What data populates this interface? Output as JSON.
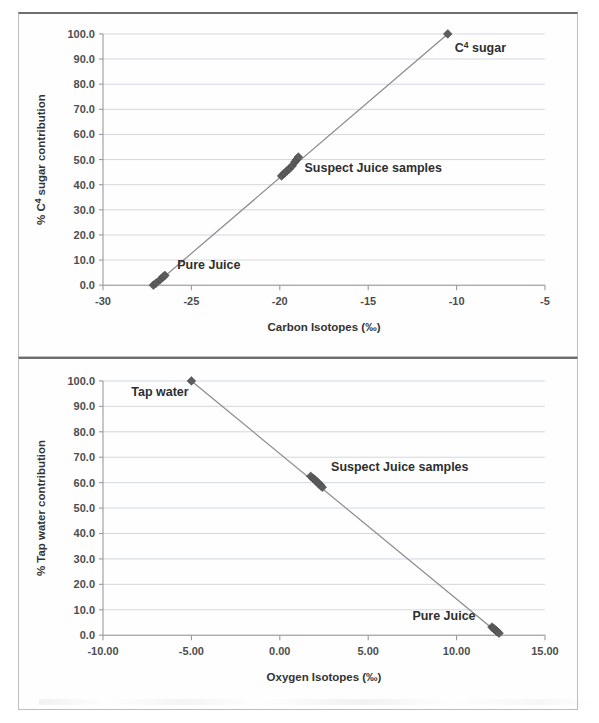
{
  "figure": {
    "background": "#ffffff",
    "panel_border_color": "#bdbdbd",
    "marker_color": "#5c5c5c",
    "line_color": "#8a8a8a",
    "grid_color": "#d2d8e0"
  },
  "chart_data": [
    {
      "id": "carbon",
      "type": "scatter",
      "title": "",
      "xlabel": "Carbon Isotopes (‰)",
      "ylabel": "% C⁴ sugar contribution",
      "ylabel_main": "% C",
      "ylabel_sup": "4",
      "ylabel_tail": " sugar contribution",
      "xlim": [
        -30,
        -5
      ],
      "ylim": [
        0,
        100
      ],
      "xticks": [
        -30,
        -25,
        -20,
        -15,
        -10,
        -5
      ],
      "xtick_labels": [
        "-30",
        "-25",
        "-20",
        "-15",
        "-10",
        "-5"
      ],
      "yticks": [
        0,
        10,
        20,
        30,
        40,
        50,
        60,
        70,
        80,
        90,
        100
      ],
      "ytick_labels": [
        "0.0",
        "10.0",
        "20.0",
        "30.0",
        "40.0",
        "50.0",
        "60.0",
        "70.0",
        "80.0",
        "90.0",
        "100.0"
      ],
      "grid": true,
      "legend": "none",
      "series": [
        {
          "name": "mixing line",
          "kind": "line",
          "x": [
            -27.1,
            -10.5
          ],
          "y": [
            0.0,
            100.0
          ]
        },
        {
          "name": "Pure Juice",
          "kind": "points",
          "x": [
            -27.15,
            -27.0,
            -26.75,
            -26.6,
            -26.5
          ],
          "y": [
            0.0,
            0.8,
            2.3,
            3.3,
            3.9
          ]
        },
        {
          "name": "Suspect Juice samples",
          "kind": "points",
          "x": [
            -19.9,
            -19.75,
            -19.6,
            -19.45,
            -19.3,
            -19.15,
            -19.05,
            -18.95
          ],
          "y": [
            43.5,
            44.5,
            45.5,
            46.4,
            47.5,
            49.0,
            50.0,
            51.0
          ]
        },
        {
          "name": "C⁴ sugar",
          "kind": "points",
          "x": [
            -10.5
          ],
          "y": [
            100.0
          ]
        }
      ],
      "annotations": [
        {
          "text": "C⁴ sugar",
          "main": "C",
          "sup": "4",
          "tail": " sugar",
          "x": -10.1,
          "y": 93.0
        },
        {
          "text": "Suspect Juice samples",
          "main": "Suspect Juice samples",
          "sup": "",
          "tail": "",
          "x": -18.6,
          "y": 45.0
        },
        {
          "text": "Pure Juice",
          "main": "Pure Juice",
          "sup": "",
          "tail": "",
          "x": -25.8,
          "y": 6.5
        }
      ]
    },
    {
      "id": "oxygen",
      "type": "scatter",
      "title": "",
      "xlabel": "Oxygen Isotopes (‰)",
      "ylabel": "% Tap water contribution",
      "ylabel_main": "% Tap water contribution",
      "ylabel_sup": "",
      "ylabel_tail": "",
      "xlim": [
        -10,
        15
      ],
      "ylim": [
        0,
        100
      ],
      "xticks": [
        -10,
        -5,
        0,
        5,
        10,
        15
      ],
      "xtick_labels": [
        "-10.00",
        "-5.00",
        "0.00",
        "5.00",
        "10.00",
        "15.00"
      ],
      "yticks": [
        0,
        10,
        20,
        30,
        40,
        50,
        60,
        70,
        80,
        90,
        100
      ],
      "ytick_labels": [
        "0.0",
        "10.0",
        "20.0",
        "30.0",
        "40.0",
        "50.0",
        "60.0",
        "70.0",
        "80.0",
        "90.0",
        "100.0"
      ],
      "grid": true,
      "legend": "none",
      "series": [
        {
          "name": "mixing line",
          "kind": "line",
          "x": [
            -5.0,
            12.4
          ],
          "y": [
            100.0,
            0.5
          ]
        },
        {
          "name": "Tap water",
          "kind": "points",
          "x": [
            -5.0
          ],
          "y": [
            100.0
          ]
        },
        {
          "name": "Suspect Juice samples",
          "kind": "points",
          "x": [
            1.75,
            1.9,
            2.0,
            2.1,
            2.2,
            2.3,
            2.4
          ],
          "y": [
            62.5,
            61.6,
            61.0,
            60.3,
            59.6,
            59.0,
            58.2
          ]
        },
        {
          "name": "Pure Juice",
          "kind": "points",
          "x": [
            12.0,
            12.1,
            12.2,
            12.3,
            12.4
          ],
          "y": [
            3.2,
            2.6,
            2.0,
            1.4,
            0.8
          ]
        }
      ],
      "annotations": [
        {
          "text": "Tap water",
          "main": "Tap water",
          "sup": "",
          "tail": "",
          "x": -8.4,
          "y": 94.0
        },
        {
          "text": "Suspect Juice samples",
          "main": "Suspect Juice samples",
          "sup": "",
          "tail": "",
          "x": 2.9,
          "y": 64.5
        },
        {
          "text": "Pure Juice",
          "main": "Pure Juice",
          "sup": "",
          "tail": "",
          "x": 7.5,
          "y": 6.0
        }
      ]
    }
  ]
}
